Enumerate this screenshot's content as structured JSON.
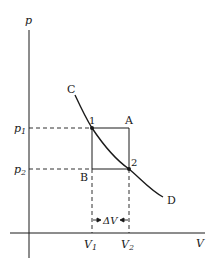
{
  "diagram": {
    "type": "pV-diagram",
    "axes": {
      "y_label": "p",
      "x_label": "V"
    },
    "curve": {
      "start_label": "C",
      "end_label": "D"
    },
    "points": {
      "p1": {
        "label": "1"
      },
      "p2": {
        "label": "2"
      },
      "corner_a": {
        "label": "A"
      },
      "corner_b": {
        "label": "B"
      }
    },
    "ticks": {
      "p1": {
        "base": "p",
        "sub": "1"
      },
      "p2": {
        "base": "p",
        "sub": "2"
      },
      "v1": {
        "base": "V",
        "sub": "1"
      },
      "v2": {
        "base": "V",
        "sub": "2"
      }
    },
    "delta": {
      "label": "ΔV"
    },
    "colors": {
      "ink": "#1a1a1a",
      "background": "#ffffff"
    }
  }
}
